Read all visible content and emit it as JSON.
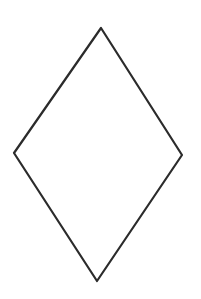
{
  "canvas": {
    "width": 201,
    "height": 299,
    "background": "#ffffff"
  },
  "shape": {
    "type": "rhombus",
    "label": "diamond",
    "stroke_color": "#2b2b2b",
    "stroke_width": 2.2,
    "fill": "none",
    "vertices": {
      "top": [
        101,
        28
      ],
      "right": [
        182,
        155
      ],
      "bottom": [
        97,
        281
      ],
      "left": [
        14,
        153
      ]
    },
    "points": "101,28 182,155 97,281 14,153"
  }
}
